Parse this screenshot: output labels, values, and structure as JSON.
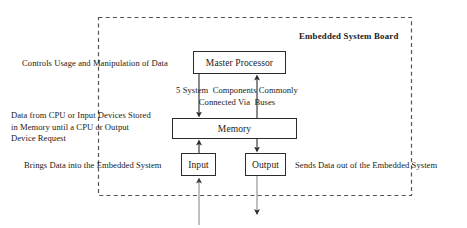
{
  "diagram": {
    "title": "Embedded System Board",
    "boundary": {
      "style": "dashed",
      "color": "#555555"
    },
    "nodes": [
      {
        "id": "master-processor",
        "label": "Master Processor"
      },
      {
        "id": "memory",
        "label": "Memory"
      },
      {
        "id": "input",
        "label": "Input"
      },
      {
        "id": "output",
        "label": "Output"
      }
    ],
    "annotations": {
      "controls_usage": "Controls Usage and Manipulation of Data",
      "bus_note_line1": "5 System  Components Commonly",
      "bus_note_line2": "Connected Via  Buses",
      "memory_desc_line1": "Data from CPU or Input Devices Stored",
      "memory_desc_line2": "in Memory until a CPU or Output",
      "memory_desc_line3": "Device Request",
      "input_desc": "Brings Data into the Embedded System",
      "output_desc": "Sends Data out of the Embedded System"
    },
    "connections": [
      {
        "id": "master-processor-to-memory",
        "from": "master-processor",
        "to": "memory",
        "direction": "down",
        "arrowhead": true
      },
      {
        "id": "memory-to-master-processor",
        "from": "memory",
        "to": "master-processor",
        "direction": "up",
        "arrowhead": true
      },
      {
        "id": "input-to-memory",
        "from": "input",
        "to": "memory",
        "direction": "up",
        "arrowhead": true
      },
      {
        "id": "memory-to-output",
        "from": "memory",
        "to": "output",
        "direction": "down",
        "arrowhead": true
      },
      {
        "id": "external-to-input",
        "from": "external",
        "to": "input",
        "direction": "up",
        "arrowhead": true
      },
      {
        "id": "output-to-external",
        "from": "output",
        "to": "external",
        "direction": "down",
        "arrowhead": true
      }
    ],
    "colors": {
      "stroke": "#2b2b2b",
      "external_stroke": "#6e6e6e",
      "text": "#1a1a1a",
      "background": "#ffffff"
    }
  }
}
